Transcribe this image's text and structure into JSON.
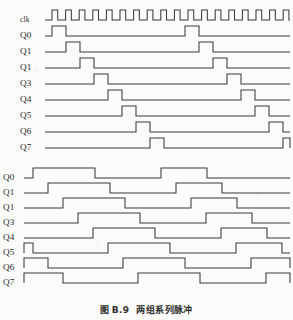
{
  "figure": {
    "caption_prefix": "图",
    "caption_number": "B.9",
    "caption_text": "两组系列脉冲"
  },
  "colors": {
    "page_background": "#fbfbfa",
    "line": "#3a3a3a",
    "text": "#2b2b2b"
  },
  "top_diagram": {
    "name": "top-timing-diagram",
    "label_column_x": 20,
    "wave_start_x": 45,
    "wave_end_x": 290,
    "rows": [
      {
        "label": "clk",
        "y": 20
      },
      {
        "label": "Q0",
        "y": 36
      },
      {
        "label": "Q1",
        "y": 52
      },
      {
        "label": "Q1",
        "y": 68
      },
      {
        "label": "Q3",
        "y": 84
      },
      {
        "label": "Q4",
        "y": 100
      },
      {
        "label": "Q5",
        "y": 116
      },
      {
        "label": "Q6",
        "y": 132
      },
      {
        "label": "Q7",
        "y": 148
      }
    ],
    "clock_pulse_count": 18
  },
  "bottom_diagram": {
    "name": "bottom-timing-diagram",
    "label_column_x": 3,
    "wave_start_x": 24,
    "wave_end_x": 290,
    "rows": [
      {
        "label": "Q0",
        "y": 178
      },
      {
        "label": "Q1",
        "y": 193
      },
      {
        "label": "Q1",
        "y": 208
      },
      {
        "label": "Q3",
        "y": 223
      },
      {
        "label": "Q4",
        "y": 238
      },
      {
        "label": "Q5",
        "y": 253
      },
      {
        "label": "Q6",
        "y": 268
      },
      {
        "label": "Q7",
        "y": 283
      }
    ]
  },
  "chart_data": {
    "type": "line",
    "xlabel": "",
    "ylabel": "",
    "signal_high_is_up": true,
    "charts": [
      {
        "name": "top",
        "signals": [
          {
            "name": "clk",
            "kind": "clock",
            "period": 13.6,
            "duty": 0.42,
            "cycles": 18,
            "start_x": 52
          },
          {
            "name": "Q0",
            "kind": "pulses",
            "pulses": [
              [
                52,
                66
              ],
              [
                185,
                199
              ]
            ]
          },
          {
            "name": "Q1",
            "kind": "pulses",
            "pulses": [
              [
                66,
                80
              ],
              [
                199,
                213
              ]
            ]
          },
          {
            "name": "Q1",
            "kind": "pulses",
            "pulses": [
              [
                80,
                94
              ],
              [
                213,
                227
              ]
            ]
          },
          {
            "name": "Q3",
            "kind": "pulses",
            "pulses": [
              [
                94,
                108
              ],
              [
                227,
                241
              ]
            ]
          },
          {
            "name": "Q4",
            "kind": "pulses",
            "pulses": [
              [
                108,
                122
              ],
              [
                241,
                255
              ]
            ]
          },
          {
            "name": "Q5",
            "kind": "pulses",
            "pulses": [
              [
                122,
                136
              ],
              [
                255,
                269
              ]
            ]
          },
          {
            "name": "Q6",
            "kind": "pulses",
            "pulses": [
              [
                136,
                150
              ],
              [
                269,
                283
              ]
            ]
          },
          {
            "name": "Q7",
            "kind": "pulses",
            "pulses": [
              [
                150,
                164
              ],
              [
                283,
                290
              ]
            ]
          }
        ]
      },
      {
        "name": "bottom",
        "signals": [
          {
            "name": "Q0",
            "kind": "pulses",
            "pulses": [
              [
                33,
                95
              ],
              [
                161,
                207
              ]
            ]
          },
          {
            "name": "Q1",
            "kind": "pulses",
            "pulses": [
              [
                48,
                110
              ],
              [
                176,
                222
              ]
            ]
          },
          {
            "name": "Q1",
            "kind": "pulses",
            "pulses": [
              [
                63,
                125
              ],
              [
                191,
                237
              ]
            ]
          },
          {
            "name": "Q3",
            "kind": "pulses",
            "pulses": [
              [
                78,
                140
              ],
              [
                206,
                252
              ]
            ]
          },
          {
            "name": "Q4",
            "kind": "pulses",
            "pulses": [
              [
                93,
                155
              ],
              [
                221,
                267
              ]
            ]
          },
          {
            "name": "Q5",
            "kind": "pulses",
            "pulses": [
              [
                24,
                33
              ],
              [
                108,
                170
              ],
              [
                236,
                282
              ]
            ]
          },
          {
            "name": "Q6",
            "kind": "pulses",
            "pulses": [
              [
                24,
                48
              ],
              [
                123,
                185
              ],
              [
                251,
                290
              ]
            ]
          },
          {
            "name": "Q7",
            "kind": "pulses",
            "pulses": [
              [
                24,
                63
              ],
              [
                138,
                200
              ],
              [
                266,
                290
              ]
            ]
          }
        ]
      }
    ]
  }
}
